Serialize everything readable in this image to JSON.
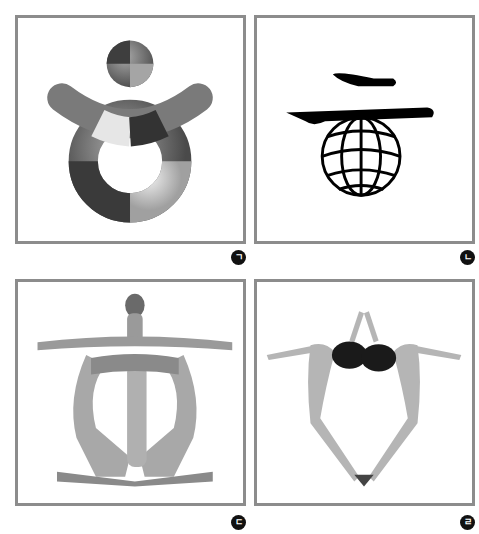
{
  "panels": [
    {
      "id": "a",
      "label": "ㄱ",
      "subject": "3D ring-and-arch symbol with sphere head",
      "frame": [
        15,
        15,
        230,
        228
      ]
    },
    {
      "id": "b",
      "label": "ㄴ",
      "subject": "brush-stroke lines above wireframe globe",
      "frame": [
        254,
        15,
        230,
        228
      ]
    },
    {
      "id": "c",
      "label": "ㄷ",
      "subject": "human figures forming circular symbol with outstretched arms",
      "frame": [
        15,
        279,
        230,
        227
      ]
    },
    {
      "id": "d",
      "label": "ㄹ",
      "subject": "two figures forming hexagonal ring with joined hands",
      "frame": [
        254,
        279,
        230,
        227
      ]
    }
  ],
  "colors": {
    "frame": "#8c8c8c",
    "badge": "#111111"
  }
}
